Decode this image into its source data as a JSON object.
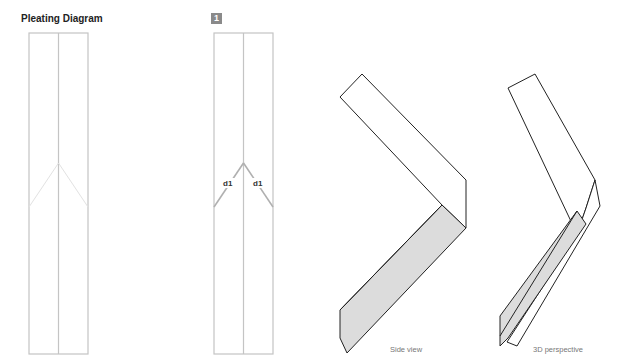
{
  "title": "Pleating Diagram",
  "step": {
    "number": "1"
  },
  "labels": {
    "fold_left": "d1",
    "fold_right": "d1"
  },
  "captions": {
    "side_view": "Side view",
    "perspective": "3D perspective"
  },
  "colors": {
    "strip_line": "#c4c4c4",
    "fold_line": "#b8b8b8",
    "outline": "#222222",
    "fill_gray": "#dcdcdc",
    "badge": "#8a8a8a"
  }
}
